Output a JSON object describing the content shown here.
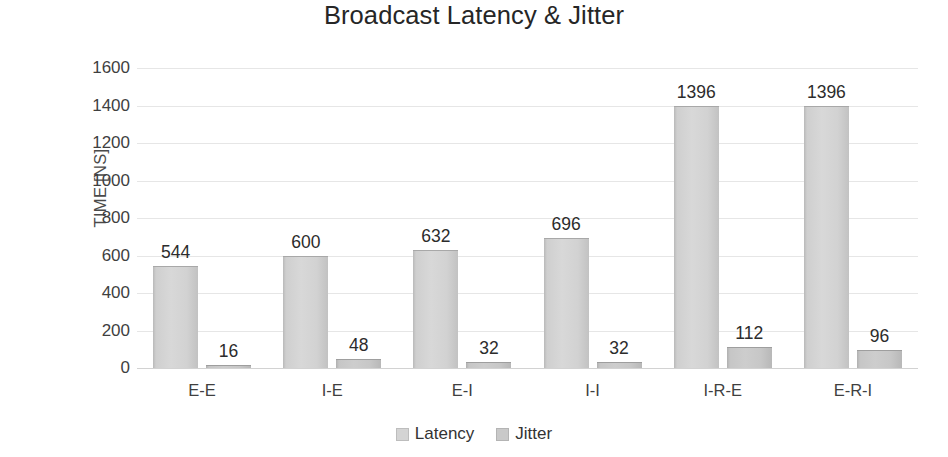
{
  "chart_data": {
    "type": "bar",
    "title": "Broadcast Latency & Jitter",
    "xlabel": "",
    "ylabel": "TIME [NS]",
    "categories": [
      "E-E",
      "I-E",
      "E-I",
      "I-I",
      "I-R-E",
      "E-R-I"
    ],
    "series": [
      {
        "name": "Latency",
        "values": [
          544,
          600,
          632,
          696,
          1396,
          1396
        ],
        "color": "#d4d4d4"
      },
      {
        "name": "Jitter",
        "values": [
          16,
          48,
          32,
          32,
          112,
          96
        ],
        "color": "#c9c9c9"
      }
    ],
    "ylim": [
      0,
      1600
    ],
    "ytick_step": 200,
    "yticks": [
      1600,
      1400,
      1200,
      1000,
      800,
      600,
      400,
      200,
      0
    ],
    "ytick_labels": [
      "1600",
      "1400",
      "1200",
      "1000",
      "800",
      "600",
      "400",
      "200",
      "0"
    ],
    "data_labels": {
      "latency": [
        "544",
        "600",
        "632",
        "696",
        "1396",
        "1396"
      ],
      "jitter": [
        "16",
        "48",
        "32",
        "32",
        "112",
        "96"
      ]
    },
    "grid": true,
    "grid_axis": "y",
    "legend": true,
    "legend_position": "bottom",
    "legend_entries": [
      "Latency",
      "Jitter"
    ],
    "background_color": "#ffffff",
    "gridline_color": "#e6e6e6",
    "axis_color": "#d2d2d2",
    "text_color": "#262626"
  }
}
